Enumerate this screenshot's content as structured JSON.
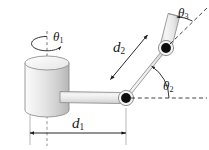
{
  "figure": {
    "background_color": "#ffffff",
    "labels": {
      "theta1": {
        "symbol": "θ",
        "subscript": "1",
        "name": "base-rotation-angle"
      },
      "theta2": {
        "symbol": "θ",
        "subscript": "2",
        "name": "elbow-angle"
      },
      "theta3": {
        "symbol": "θ",
        "subscript": "3",
        "name": "wrist-angle"
      },
      "d1": {
        "symbol": "d",
        "subscript": "1",
        "name": "link1-length"
      },
      "d2": {
        "symbol": "d",
        "subscript": "2",
        "name": "link2-length"
      }
    },
    "colors": {
      "link_fill_light": "#f4f4f4",
      "link_fill_mid": "#e2e2e2",
      "link_fill_dark": "#c9c9c9",
      "outline": "#6b6b6b",
      "joint": "#111111",
      "dashed": "#333333",
      "text": "#1a1a1a"
    },
    "geometry": {
      "cylinder": {
        "cx": 47,
        "top_y": 63,
        "bottom_y": 110,
        "rx": 22,
        "ry": 7
      },
      "joint1": {
        "cx": 126,
        "cy": 98,
        "r": 6.5
      },
      "joint2": {
        "cx": 166,
        "cy": 48,
        "r": 6.5
      },
      "link1_span_x": [
        30,
        126
      ],
      "dimension_line_y": 133
    }
  }
}
